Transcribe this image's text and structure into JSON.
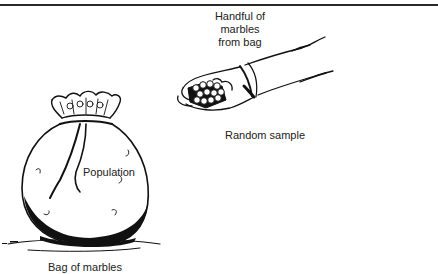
{
  "figure": {
    "caption_partial": "",
    "labels": {
      "handful": [
        "Handful of",
        "marbles",
        "from bag"
      ],
      "random_sample": "Random sample",
      "population": "Population",
      "bag": "Bag of marbles"
    },
    "elements": {
      "hand": "hand-holding-marbles-illustration",
      "bag": "bag-of-marbles-illustration"
    },
    "colors": {
      "ink": "#1a1a1a",
      "background": "#ffffff"
    }
  }
}
